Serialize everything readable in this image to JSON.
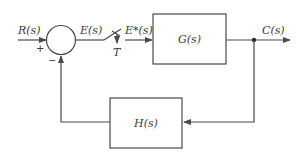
{
  "diagram": {
    "type": "sampled-data feedback control block diagram",
    "signals": {
      "input": "R(s)",
      "error": "E(s)",
      "sampled_error": "E*(s)",
      "output": "C(s)"
    },
    "summing_junction": {
      "plus_sign": "+",
      "minus_sign": "−"
    },
    "sampler": {
      "period_label": "T"
    },
    "blocks": {
      "forward": "G(s)",
      "feedback": "H(s)"
    },
    "colors": {
      "line": "#4a4a4a",
      "text": "#3a3a3a",
      "background": "#ffffff"
    }
  }
}
